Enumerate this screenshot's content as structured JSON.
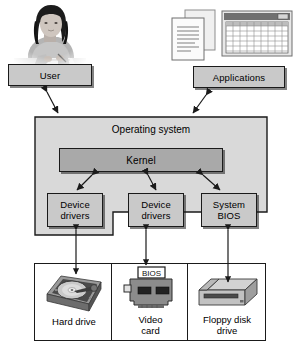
{
  "diagram": {
    "colors": {
      "box_fill": "#c9c9c9",
      "os_fill": "#d9d9d9",
      "kernel_fill": "#a9a9a9",
      "outline": "#1a1a1a",
      "background": "#ffffff",
      "arrow": "#1a1a1a"
    },
    "nodes": {
      "user": {
        "label": "User"
      },
      "applications": {
        "label": "Applications"
      },
      "operating_system": {
        "label": "Operating system"
      },
      "kernel": {
        "label": "Kernel"
      },
      "device_drivers_left": {
        "label": "Device\ndrivers",
        "line1": "Device",
        "line2": "drivers"
      },
      "device_drivers_middle": {
        "label": "Device\ndrivers",
        "line1": "Device",
        "line2": "drivers"
      },
      "system_bios": {
        "label": "System\nBIOS",
        "line1": "System",
        "line2": "BIOS"
      }
    },
    "hardware": {
      "items": [
        {
          "label": "Hard drive",
          "line1": "Hard drive",
          "line2": "",
          "icon": "hard-drive-icon"
        },
        {
          "label": "Video card",
          "line1": "Video",
          "line2": "card",
          "icon": "video-card-icon",
          "chip_label": "BIOS"
        },
        {
          "label": "Floppy disk drive",
          "line1": "Floppy disk",
          "line2": "drive",
          "icon": "floppy-disk-drive-icon"
        }
      ]
    },
    "illustrations": {
      "user_photo": {
        "name": "user-at-desk-photo"
      },
      "documents": {
        "name": "documents-icon"
      },
      "spreadsheet": {
        "name": "spreadsheet-window-icon"
      }
    },
    "connectors": [
      {
        "from": "user",
        "to": "operating_system",
        "type": "double-arrow"
      },
      {
        "from": "applications",
        "to": "operating_system",
        "type": "double-arrow"
      },
      {
        "from": "kernel",
        "to": "device_drivers_left",
        "type": "double-arrow"
      },
      {
        "from": "kernel",
        "to": "device_drivers_middle",
        "type": "double-arrow"
      },
      {
        "from": "kernel",
        "to": "system_bios",
        "type": "double-arrow"
      },
      {
        "from": "device_drivers_left",
        "to": "hard_drive",
        "type": "double-arrow"
      },
      {
        "from": "device_drivers_middle",
        "to": "video_card",
        "type": "double-arrow"
      },
      {
        "from": "system_bios",
        "to": "floppy_disk_drive",
        "type": "double-arrow"
      }
    ]
  }
}
